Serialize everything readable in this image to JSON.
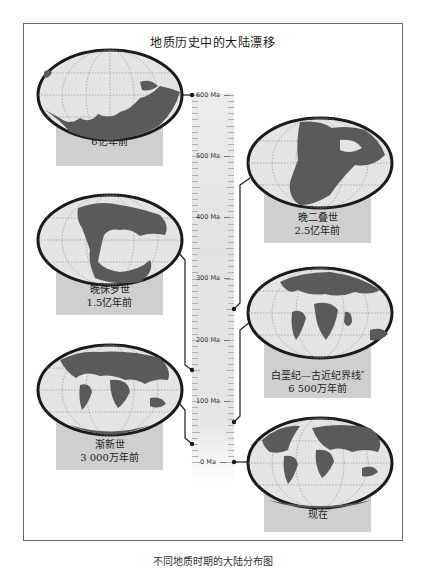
{
  "title": "地质历史中的大陆漂移",
  "caption": "不同地质时期的大陆分布图",
  "timeline": {
    "unit": "Ma",
    "ticks": [
      {
        "value": 600,
        "label": "600 Ma"
      },
      {
        "value": 500,
        "label": "500 Ma"
      },
      {
        "value": 400,
        "label": "400 Ma"
      },
      {
        "value": 300,
        "label": "300 Ma"
      },
      {
        "value": 200,
        "label": "200 Ma"
      },
      {
        "value": 100,
        "label": "100 Ma"
      },
      {
        "value": 0,
        "label": "0 Ma"
      }
    ]
  },
  "periods": [
    {
      "name": "前寒武纪晚期",
      "age": "6亿年前",
      "age_ma": 600,
      "side": "left"
    },
    {
      "name": "晚二叠世",
      "age": "2.5亿年前",
      "age_ma": 250,
      "side": "right"
    },
    {
      "name": "晚侏罗世",
      "age": "1.5亿年前",
      "age_ma": 150,
      "side": "left"
    },
    {
      "name": "白垩纪—古近纪界线",
      "name_mark": "*",
      "age": "6 500万年前",
      "age_ma": 65,
      "side": "right"
    },
    {
      "name": "渐新世",
      "age": "3 000万年前",
      "age_ma": 30,
      "side": "left"
    },
    {
      "name": "现在",
      "age": "",
      "age_ma": 0,
      "side": "right"
    }
  ],
  "colors": {
    "frame": "#6d6d6d",
    "label_box": "#cfcfcf",
    "globe_ocean": "#e4e4e4",
    "globe_land": "#5a5a5a",
    "globe_outline": "#1a1a1a",
    "timeline_bar": "#e6e6e6",
    "connector": "#1a1a1a"
  }
}
